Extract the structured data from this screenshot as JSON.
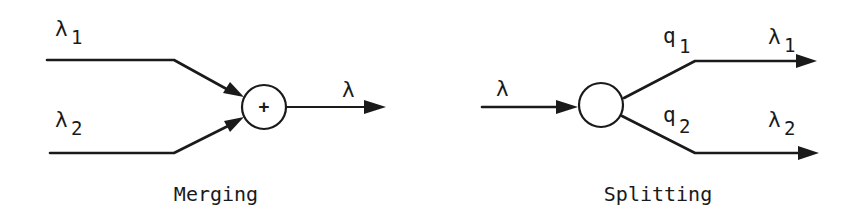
{
  "merging": {
    "caption": "Merging",
    "inputs": [
      {
        "symbol": "λ",
        "subscript": "1"
      },
      {
        "symbol": "λ",
        "subscript": "2"
      }
    ],
    "operator": "+",
    "output": {
      "symbol": "λ"
    }
  },
  "splitting": {
    "caption": "Splitting",
    "input": {
      "symbol": "λ"
    },
    "branches": [
      {
        "prob_symbol": "q",
        "prob_subscript": "1",
        "out_symbol": "λ",
        "out_subscript": "1"
      },
      {
        "prob_symbol": "q",
        "prob_subscript": "2",
        "out_symbol": "λ",
        "out_subscript": "2"
      }
    ]
  },
  "colors": {
    "ink": "#1a1a1a",
    "background": "#ffffff"
  }
}
